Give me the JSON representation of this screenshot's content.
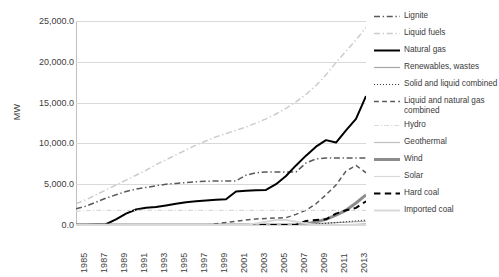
{
  "chart_data": {
    "type": "line",
    "title": "",
    "xlabel": "",
    "ylabel": "MW",
    "ylim": [
      0,
      25000
    ],
    "ytick_labels": [
      "0.0",
      "5,000.0",
      "10,000.0",
      "15,000.0",
      "20,000.0",
      "25,000.0"
    ],
    "ytick_values": [
      0,
      5000,
      10000,
      15000,
      20000,
      25000
    ],
    "grid": true,
    "legend_position": "right",
    "x": [
      1985,
      1986,
      1987,
      1988,
      1989,
      1990,
      1991,
      1992,
      1993,
      1994,
      1995,
      1996,
      1997,
      1998,
      1999,
      2000,
      2001,
      2002,
      2003,
      2004,
      2005,
      2006,
      2007,
      2008,
      2009,
      2010,
      2011,
      2012,
      2013,
      2014
    ],
    "xtick_labels": [
      "1985",
      "1987",
      "1989",
      "1991",
      "1993",
      "1995",
      "1997",
      "1999",
      "2001",
      "2003",
      "2005",
      "2007",
      "2009",
      "2011",
      "2013"
    ],
    "series": [
      {
        "name": "Lignite",
        "style": "dashdot",
        "color": "#595959",
        "width": 1.5,
        "values": [
          2000,
          2300,
          2800,
          3300,
          3700,
          4100,
          4400,
          4600,
          4800,
          5000,
          5100,
          5200,
          5300,
          5350,
          5400,
          5400,
          5400,
          6100,
          6400,
          6500,
          6500,
          6500,
          6500,
          7600,
          8100,
          8200,
          8200,
          8200,
          8200,
          8200
        ]
      },
      {
        "name": "Liquid fuels",
        "style": "dashdot",
        "color": "#cccccc",
        "width": 1.5,
        "values": [
          2600,
          3100,
          3700,
          4300,
          4900,
          5500,
          6100,
          6700,
          7400,
          8000,
          8600,
          9200,
          9800,
          10300,
          10800,
          11200,
          11600,
          12000,
          12500,
          13000,
          13600,
          14300,
          15100,
          16000,
          17100,
          18400,
          19900,
          21300,
          22700,
          24200
        ]
      },
      {
        "name": "Natural gas",
        "style": "solid",
        "color": "#000000",
        "width": 2,
        "values": [
          20,
          40,
          60,
          100,
          700,
          1400,
          1900,
          2100,
          2200,
          2400,
          2600,
          2800,
          2900,
          3000,
          3100,
          3150,
          4100,
          4200,
          4250,
          4300,
          5000,
          6000,
          7300,
          8500,
          9600,
          10400,
          10100,
          11600,
          13000,
          15800
        ]
      },
      {
        "name": "Renewables, wastes",
        "style": "solid",
        "color": "#a6a6a6",
        "width": 1.2,
        "values": [
          0,
          0,
          0,
          0,
          0,
          0,
          0,
          0,
          0,
          0,
          0,
          0,
          0,
          0,
          0,
          0,
          0,
          0,
          0,
          20,
          40,
          60,
          80,
          120,
          160,
          220,
          280,
          340,
          400,
          460
        ]
      },
      {
        "name": "Solid and liquid combined",
        "style": "dotted",
        "color": "#404040",
        "width": 1.2,
        "values": [
          0,
          0,
          0,
          0,
          0,
          0,
          0,
          0,
          0,
          0,
          0,
          0,
          0,
          0,
          0,
          0,
          0,
          0,
          0,
          0,
          0,
          0,
          0,
          0,
          100,
          200,
          300,
          400,
          500,
          600
        ]
      },
      {
        "name": "Liquid and natural gas combined",
        "style": "dashed",
        "color": "#595959",
        "width": 1.5,
        "values": [
          0,
          0,
          0,
          0,
          0,
          0,
          0,
          0,
          0,
          0,
          0,
          0,
          0,
          0,
          150,
          300,
          450,
          600,
          750,
          800,
          850,
          900,
          1300,
          1800,
          2600,
          3700,
          4900,
          6600,
          7300,
          6400
        ]
      },
      {
        "name": "Hydro",
        "style": "dashdot",
        "color": "#d9d9d9",
        "width": 1.2,
        "values": [
          1700,
          1750,
          1800,
          1800,
          1800,
          1800,
          1800,
          1800,
          1800,
          1800,
          1800,
          1800,
          1800,
          1800,
          1800,
          1800,
          1800,
          1800,
          1800,
          1800,
          1800,
          1800,
          1800,
          1800,
          1800,
          1800,
          1800,
          1800,
          1800,
          1800
        ]
      },
      {
        "name": "Geothermal",
        "style": "solid",
        "color": "#bfbfbf",
        "width": 1.2,
        "values": [
          0,
          0,
          0,
          0,
          0,
          0,
          0,
          0,
          0,
          0,
          0,
          0,
          0,
          0,
          0,
          0,
          0,
          0,
          0,
          0,
          0,
          0,
          0,
          0,
          0,
          0,
          0,
          40,
          90,
          160
        ]
      },
      {
        "name": "Wind",
        "style": "solid",
        "color": "#8c8c8c",
        "width": 3,
        "values": [
          0,
          0,
          0,
          0,
          0,
          0,
          0,
          0,
          0,
          0,
          0,
          0,
          0,
          0,
          0,
          0,
          0,
          0,
          0,
          0,
          0,
          0,
          30,
          140,
          380,
          700,
          1200,
          1800,
          2700,
          3700
        ]
      },
      {
        "name": "Solar",
        "style": "solid",
        "color": "#d9d9d9",
        "width": 1.2,
        "values": [
          0,
          0,
          0,
          0,
          0,
          0,
          0,
          0,
          0,
          0,
          0,
          0,
          0,
          0,
          0,
          0,
          0,
          0,
          0,
          0,
          0,
          0,
          0,
          0,
          0,
          0,
          0,
          0,
          0,
          40
        ]
      },
      {
        "name": "Hard coal",
        "style": "dashed",
        "color": "#000000",
        "width": 2,
        "values": [
          0,
          0,
          0,
          0,
          0,
          0,
          0,
          0,
          0,
          0,
          0,
          0,
          0,
          0,
          0,
          0,
          0,
          0,
          0,
          0,
          0,
          0,
          0,
          500,
          600,
          700,
          1400,
          1800,
          2100,
          2900
        ]
      },
      {
        "name": "Imported coal",
        "style": "solid",
        "color": "#d9d9d9",
        "width": 2,
        "values": [
          0,
          0,
          0,
          0,
          0,
          0,
          0,
          0,
          0,
          0,
          0,
          0,
          0,
          0,
          0,
          0,
          0,
          0,
          200,
          400,
          600,
          600,
          400,
          200,
          0,
          0,
          0,
          0,
          0,
          0
        ]
      }
    ]
  }
}
